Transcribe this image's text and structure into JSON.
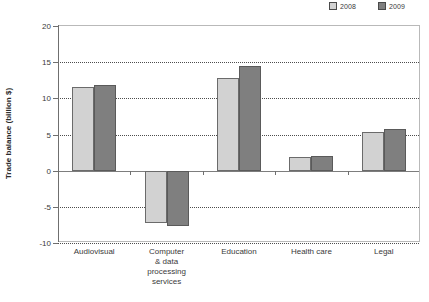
{
  "chart_data": {
    "type": "bar",
    "title": "",
    "xlabel": "",
    "ylabel": "Trade balance (billion $)",
    "ylim": [
      -10,
      20
    ],
    "yticks": [
      20,
      15,
      10,
      5,
      0,
      -5,
      -10
    ],
    "ytick_labels": [
      "20",
      "15",
      "10",
      "5",
      "0",
      "-5",
      "-10"
    ],
    "grid": true,
    "legend_position": "top-right",
    "categories": [
      "Audiovisual",
      "Computer & data processing services",
      "Education",
      "Health care",
      "Legal"
    ],
    "category_lines": [
      [
        "Audiovisual"
      ],
      [
        "Computer",
        "& data",
        "processing",
        "services"
      ],
      [
        "Education"
      ],
      [
        "Health care"
      ],
      [
        "Legal"
      ]
    ],
    "series": [
      {
        "name": "2008",
        "color": "#d2d2d2",
        "values": [
          11.5,
          -7.3,
          12.8,
          1.9,
          5.4
        ]
      },
      {
        "name": "2009",
        "color": "#7f7f7f",
        "values": [
          11.8,
          -7.6,
          14.5,
          2.0,
          5.7
        ]
      }
    ]
  },
  "legend": {
    "entries": [
      {
        "label": "2008",
        "color": "#d2d2d2"
      },
      {
        "label": "2009",
        "color": "#7f7f7f"
      }
    ]
  }
}
